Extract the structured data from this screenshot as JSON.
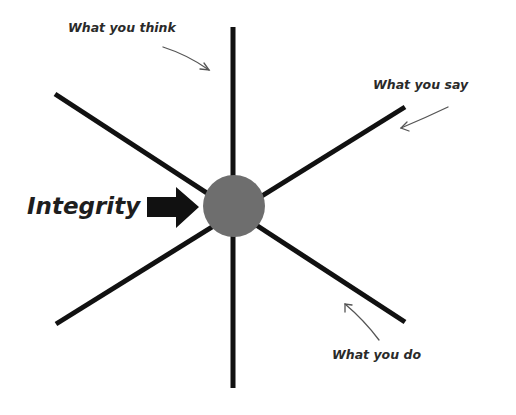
{
  "diagram": {
    "center_label": "Integrity",
    "labels": {
      "think": "What you think",
      "say": "What you say",
      "do": "What you do"
    },
    "colors": {
      "line": "#111111",
      "circle": "#6e6e6e",
      "arrow": "#111111",
      "text": "#2a2a2a",
      "pointer": "#555555"
    },
    "nodes": [
      "What you think",
      "What you say",
      "What you do"
    ],
    "edges": [
      {
        "from": "Integrity",
        "to": "What you think",
        "kind": "vertical line"
      },
      {
        "from": "Integrity",
        "to": "What you say",
        "kind": "diagonal line"
      },
      {
        "from": "Integrity",
        "to": "What you do",
        "kind": "diagonal line"
      }
    ]
  }
}
